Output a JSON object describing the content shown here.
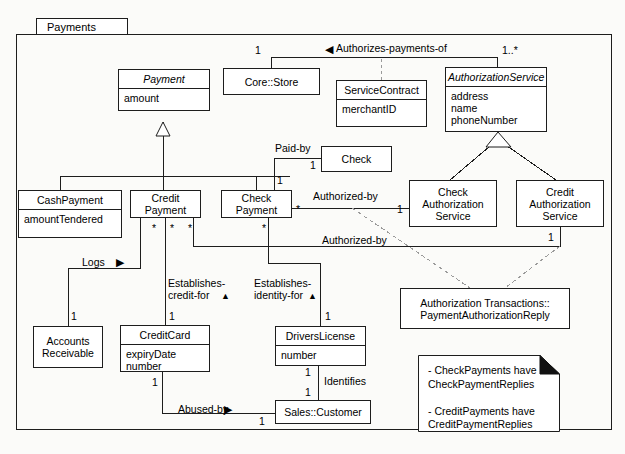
{
  "package": {
    "name": "Payments"
  },
  "classes": {
    "payment": {
      "name": "Payment",
      "attributes": "amount"
    },
    "core_store": {
      "name": "Core::Store"
    },
    "service_contract": {
      "name": "ServiceContract",
      "attributes": "merchantID"
    },
    "authorization_service": {
      "name": "AuthorizationService",
      "attributes": "address\nname\nphoneNumber"
    },
    "check": {
      "name": "Check"
    },
    "cash_payment": {
      "name": "CashPayment",
      "attributes": "amountTendered"
    },
    "credit_payment": {
      "name": "Credit\nPayment"
    },
    "check_payment": {
      "name": "Check\nPayment"
    },
    "check_auth_service": {
      "name": "Check\nAuthorization\nService"
    },
    "credit_auth_service": {
      "name": "Credit\nAuthorization\nService"
    },
    "accounts_receivable": {
      "name": "Accounts\nReceivable"
    },
    "credit_card": {
      "name": "CreditCard",
      "attributes": "expiryDate\nnumber"
    },
    "drivers_license": {
      "name": "DriversLicense",
      "attributes": "number"
    },
    "sales_customer": {
      "name": "Sales::Customer"
    },
    "auth_transactions": {
      "name": "Authorization Transactions::\nPaymentAuthorizationReply"
    }
  },
  "associations": {
    "authorizes_payments_of": "Authorizes-payments-of",
    "authorizes_arrow": "◀",
    "paid_by": "Paid-by",
    "authorized_by_check": "Authorized-by",
    "authorized_by_credit": "Authorized-by",
    "logs": "Logs",
    "logs_arrow": "▶",
    "establishes_credit_for": "Establishes-\ncredit-for",
    "establishes_credit_arrow": "▲",
    "establishes_identity_for": "Establishes-\nidentity-for",
    "establishes_identity_arrow": "▲",
    "identifies": "Identifies",
    "abused_by": "Abused-by",
    "abused_by_arrow": "▶"
  },
  "multiplicities": {
    "store_one": "1",
    "auth_service_many": "1..*",
    "check_one": "1",
    "check_payment_paidby_one": "1",
    "check_payment_auth_star": "*",
    "check_auth_one": "1",
    "credit_auth_one": "1",
    "credit_payment_star_1": "*",
    "credit_payment_star_2": "*",
    "credit_payment_star_3": "*",
    "check_payment_star_bottom": "*",
    "accounts_receivable_one": "1",
    "credit_card_one_top": "1",
    "credit_card_one_bottom": "1",
    "drivers_license_one_top": "1",
    "drivers_license_one_bottom": "1",
    "customer_one_identifies": "1",
    "customer_one_abused": "1"
  },
  "note": {
    "text": "- CheckPayments have\n   CheckPaymentReplies\n\n- CreditPayments have\n   CreditPaymentReplies"
  },
  "colors": {
    "line": "#1d1d1d",
    "fill": "#ffffff",
    "background": "#fbfbf9",
    "dashed": "#8a8a8a",
    "note_fold": "#111111"
  }
}
